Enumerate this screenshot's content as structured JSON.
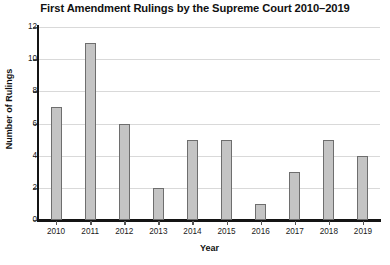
{
  "chart_data": {
    "type": "bar",
    "title": "First Amendment Rulings by the Supreme Court 2010–2019",
    "xlabel": "Year",
    "ylabel": "Number of Rulings",
    "categories": [
      "2010",
      "2011",
      "2012",
      "2013",
      "2014",
      "2015",
      "2016",
      "2017",
      "2018",
      "2019"
    ],
    "values": [
      7,
      11,
      6,
      2,
      5,
      5,
      1,
      3,
      5,
      4
    ],
    "ylim": [
      0,
      12
    ],
    "yticks": [
      0,
      2,
      4,
      6,
      8,
      10,
      12
    ],
    "ytick_labels": [
      "0",
      "2",
      "4",
      "6",
      "8",
      "10",
      "12"
    ],
    "grid": "horizontal",
    "legend": "none",
    "colors": {
      "bar_fill": "#c4c4c4",
      "bar_edge": "#6e6e6e",
      "gridline": "#d9d9d9",
      "axis": "#141414",
      "background": "#ffffff",
      "text": "#1a1a1a"
    }
  }
}
